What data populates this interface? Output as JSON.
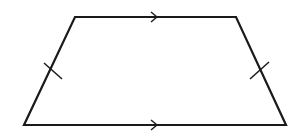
{
  "diagram": {
    "type": "isosceles-trapezoid",
    "stroke_color": "#1a1a1a",
    "background": "#ffffff",
    "stroke_width": 2.2,
    "vertices": {
      "top_left": [
        75,
        17
      ],
      "top_right": [
        236,
        17
      ],
      "bottom_right": [
        286,
        125
      ],
      "bottom_left": [
        24,
        125
      ]
    },
    "parallel_markers": [
      {
        "name": "top-parallel-arrow",
        "at": [
          157,
          17
        ],
        "direction": "right"
      },
      {
        "name": "bottom-parallel-arrow",
        "at": [
          157,
          125
        ],
        "direction": "right"
      }
    ],
    "congruence_ticks": [
      {
        "name": "left-leg-tick",
        "from": [
          44,
          63
        ],
        "to": [
          62,
          79
        ]
      },
      {
        "name": "right-leg-tick",
        "from": [
          250,
          79
        ],
        "to": [
          269,
          62
        ]
      }
    ],
    "labels": []
  }
}
